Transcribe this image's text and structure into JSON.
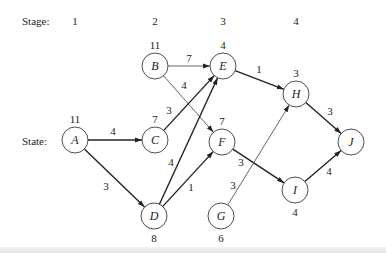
{
  "header": {
    "stage_label": "Stage:",
    "state_label": "State:",
    "stages": [
      {
        "label": "1",
        "x": 75
      },
      {
        "label": "2",
        "x": 155
      },
      {
        "label": "3",
        "x": 223
      },
      {
        "label": "4",
        "x": 296
      }
    ]
  },
  "nodes": [
    {
      "id": "A",
      "x": 75,
      "y": 140,
      "value": "11",
      "value_pos": "top"
    },
    {
      "id": "B",
      "x": 155,
      "y": 66,
      "value": "11",
      "value_pos": "top"
    },
    {
      "id": "C",
      "x": 155,
      "y": 140,
      "value": "7",
      "value_pos": "top"
    },
    {
      "id": "D",
      "x": 154,
      "y": 216,
      "value": "8",
      "value_pos": "bottom"
    },
    {
      "id": "E",
      "x": 223,
      "y": 66,
      "value": "4",
      "value_pos": "top"
    },
    {
      "id": "F",
      "x": 222,
      "y": 142,
      "value": "7",
      "value_pos": "top"
    },
    {
      "id": "G",
      "x": 221,
      "y": 216,
      "value": "6",
      "value_pos": "bottom"
    },
    {
      "id": "H",
      "x": 296,
      "y": 94,
      "value": "3",
      "value_pos": "top"
    },
    {
      "id": "I",
      "x": 295,
      "y": 190,
      "value": "4",
      "value_pos": "bottom"
    },
    {
      "id": "J",
      "x": 351,
      "y": 142,
      "value": "",
      "value_pos": "none"
    }
  ],
  "edges": [
    {
      "from": "A",
      "to": "C",
      "weight": "4",
      "lx": 113,
      "ly": 135,
      "bold": true
    },
    {
      "from": "A",
      "to": "D",
      "weight": "3",
      "lx": 106,
      "ly": 190,
      "bold": true
    },
    {
      "from": "B",
      "to": "E",
      "weight": "7",
      "lx": 189,
      "ly": 62,
      "bold": false
    },
    {
      "from": "B",
      "to": "F",
      "weight": "4",
      "lx": 184,
      "ly": 89,
      "bold": false
    },
    {
      "from": "C",
      "to": "E",
      "weight": "3",
      "lx": 169,
      "ly": 114,
      "bold": true
    },
    {
      "from": "D",
      "to": "E",
      "weight": "4",
      "lx": 171,
      "ly": 166,
      "bold": true
    },
    {
      "from": "D",
      "to": "F",
      "weight": "1",
      "lx": 191,
      "ly": 191,
      "bold": true
    },
    {
      "from": "E",
      "to": "H",
      "weight": "1",
      "lx": 259,
      "ly": 73,
      "bold": true
    },
    {
      "from": "F",
      "to": "I",
      "weight": "3",
      "lx": 241,
      "ly": 166,
      "bold": true
    },
    {
      "from": "G",
      "to": "H",
      "weight": "3",
      "lx": 233,
      "ly": 189,
      "bold": false
    },
    {
      "from": "H",
      "to": "J",
      "weight": "3",
      "lx": 330,
      "ly": 115,
      "bold": true
    },
    {
      "from": "I",
      "to": "J",
      "weight": "4",
      "lx": 329,
      "ly": 175,
      "bold": true
    }
  ],
  "style": {
    "node_radius": 13,
    "stroke_color": "#222222",
    "node_fill": "#ffffff"
  }
}
